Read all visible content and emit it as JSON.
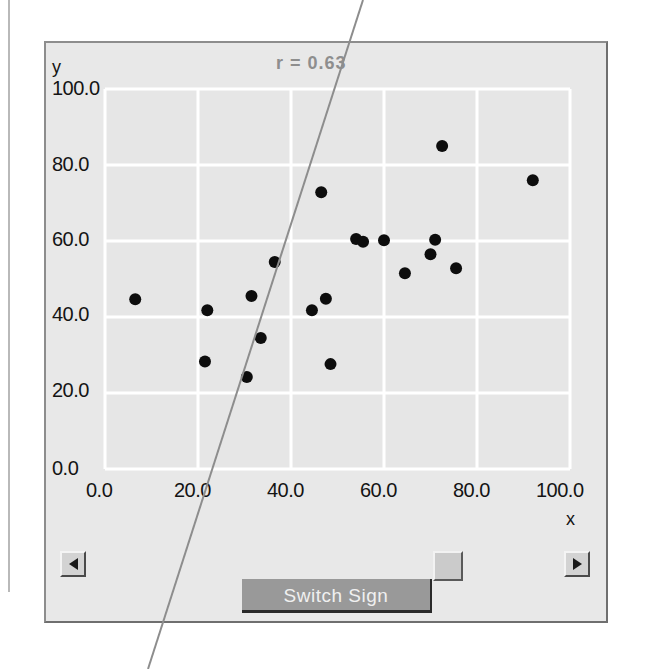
{
  "window": {
    "title": "Correlation Scatter Plot Applet"
  },
  "chart": {
    "title": "r = 0.63",
    "ylabel": "y",
    "xlabel": "x",
    "x_ticks": [
      "0.0",
      "20.0",
      "40.0",
      "60.0",
      "80.0",
      "100.0"
    ],
    "y_ticks": [
      "0.0",
      "20.0",
      "40.0",
      "60.0",
      "80.0",
      "100.0"
    ],
    "grid_color": "#ffffff",
    "plot_bg_color": "#e6e6e6",
    "point_color": "#0d0d0d",
    "line_color": "#7a7a7a"
  },
  "controls": {
    "switch_sign_label": "Switch Sign",
    "scroll_left_label": "◄",
    "scroll_right_label": "►",
    "scroll_thumb_label": ""
  },
  "chart_data": {
    "type": "scatter",
    "title": "r = 0.63",
    "xlabel": "x",
    "ylabel": "y",
    "xlim": [
      0,
      100
    ],
    "ylim": [
      0,
      100
    ],
    "xticks": [
      0,
      20,
      40,
      60,
      80,
      100
    ],
    "yticks": [
      0,
      20,
      40,
      60,
      80,
      100
    ],
    "grid": true,
    "legend": false,
    "correlation": 0.63,
    "series": [
      {
        "name": "data",
        "marker": "filled-circle",
        "color": "#0d0d0d",
        "points": [
          [
            6.5,
            44.7
          ],
          [
            22.0,
            41.8
          ],
          [
            21.5,
            28.3
          ],
          [
            30.5,
            24.2
          ],
          [
            31.5,
            45.5
          ],
          [
            33.5,
            34.5
          ],
          [
            36.5,
            54.5
          ],
          [
            44.5,
            41.8
          ],
          [
            46.5,
            72.8
          ],
          [
            47.5,
            44.8
          ],
          [
            48.5,
            27.6
          ],
          [
            54.0,
            60.5
          ],
          [
            55.5,
            59.8
          ],
          [
            60.0,
            60.2
          ],
          [
            64.5,
            51.5
          ],
          [
            70.0,
            56.5
          ],
          [
            71.0,
            60.3
          ],
          [
            72.5,
            85.0
          ],
          [
            75.5,
            52.8
          ],
          [
            92.0,
            76.0
          ]
        ]
      }
    ],
    "annotation_line": {
      "description": "steep diagonal scan artifact crossing the figure",
      "color": "#7a7a7a"
    }
  }
}
